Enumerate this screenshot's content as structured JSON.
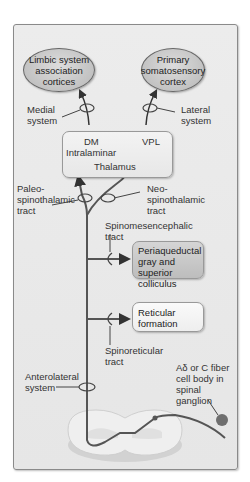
{
  "targets": {
    "limbic": "Limbic system association cortices",
    "somatosensory": "Primary somatosensory cortex"
  },
  "systems": {
    "medial": "Medial system",
    "lateral": "Lateral system"
  },
  "thalamus": {
    "dm": "DM",
    "intralaminar": "Intralaminar",
    "vpl": "VPL",
    "title": "Thalamus"
  },
  "tracts": {
    "paleo": "Paleo- spinothalamic tract",
    "neo": "Neo- spinothalamic tract",
    "spinomes": "Spinomesencephalic tract",
    "spinoret": "Spinoreticular tract",
    "anterolateral": "Anterolateral system"
  },
  "nuclei": {
    "pag": "Periaqueductal gray and superior colliculus",
    "reticular": "Reticular formation"
  },
  "ganglion": {
    "label": "Aδ or C fiber cell body in spinal ganglion"
  },
  "colors": {
    "fiber": "#555555",
    "frame_bg": "#e8e8e8",
    "oval": "#c4c4c4",
    "pag_box": "#c6c6c6",
    "cell_body": "#6e6e6e"
  }
}
